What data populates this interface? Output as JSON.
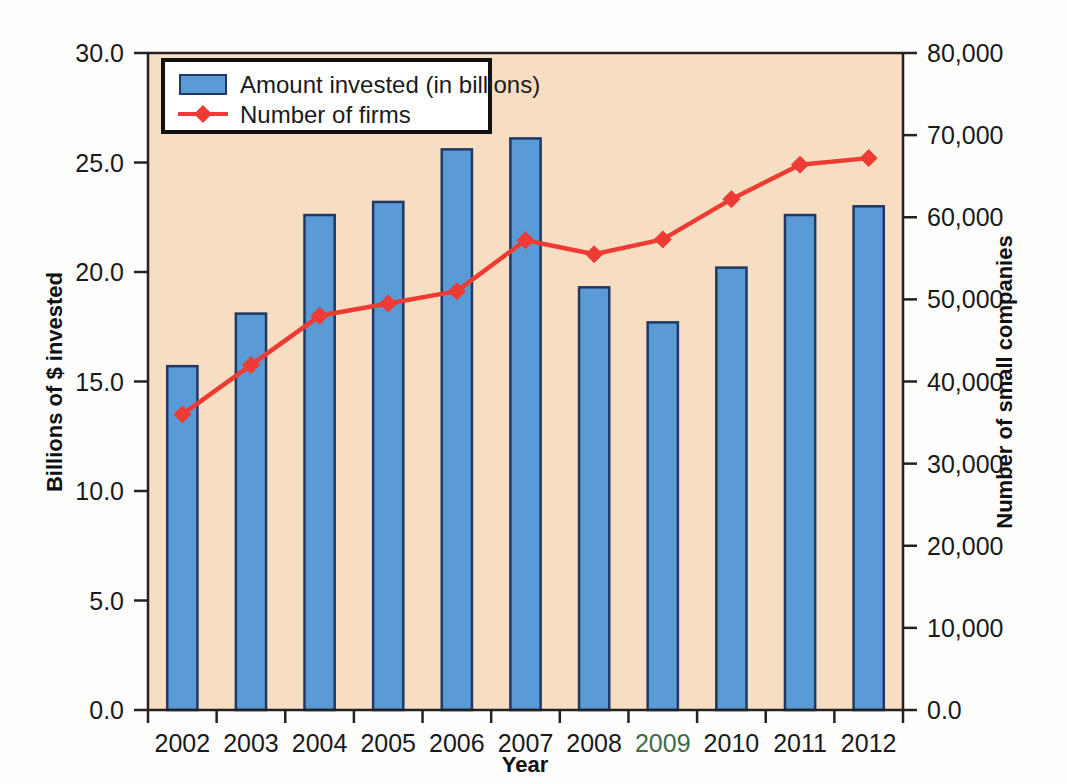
{
  "chart_data": {
    "type": "bar",
    "title": "",
    "subtitle": "",
    "xlabel": "Year",
    "ylabel": "Billions of $ invested",
    "y2label": "Number of small companies",
    "categories": [
      "2002",
      "2003",
      "2004",
      "2005",
      "2006",
      "2007",
      "2008",
      "2009",
      "2010",
      "2011",
      "2012"
    ],
    "ylim": [
      0,
      30
    ],
    "y2lim": [
      0,
      80000
    ],
    "yticks": [
      "0.0",
      "5.0",
      "10.0",
      "15.0",
      "20.0",
      "25.0",
      "30.0"
    ],
    "ytick_values": [
      0,
      5,
      10,
      15,
      20,
      25,
      30
    ],
    "y2ticks": [
      "0.0",
      "10,000",
      "20,000",
      "30,000",
      "40,000",
      "50,000",
      "60,000",
      "70,000",
      "80,000"
    ],
    "y2tick_values": [
      0,
      10000,
      20000,
      30000,
      40000,
      50000,
      60000,
      70000,
      80000
    ],
    "grid": false,
    "legend_position": "top-left",
    "series": [
      {
        "name": "Amount invested (in billions)",
        "type": "bar",
        "axis": "left",
        "color": "#5B9BD5",
        "edge_color": "#1f3864",
        "values": [
          15.7,
          18.1,
          22.6,
          23.2,
          25.6,
          26.1,
          19.3,
          17.7,
          20.2,
          22.6,
          23.0
        ]
      },
      {
        "name": "Number of firms",
        "type": "line",
        "axis": "right",
        "color": "#EE3B33",
        "marker": "diamond",
        "values": [
          36000,
          42000,
          48000,
          49500,
          51000,
          57200,
          55500,
          57300,
          62200,
          66400,
          67200
        ]
      }
    ],
    "plot_background": "#F7DEC2",
    "figure_background": "#FDFDFC"
  },
  "legend": {
    "items": [
      {
        "label": "Amount invested (in billions)",
        "marker": "bar-swatch",
        "color": "#5B9BD5"
      },
      {
        "label": "Number of firms",
        "marker": "line-diamond",
        "color": "#EE3B33"
      }
    ]
  },
  "axes": {
    "left_title": "Billions of $ invested",
    "right_title": "Number of small companies",
    "bottom_title": "Year"
  }
}
